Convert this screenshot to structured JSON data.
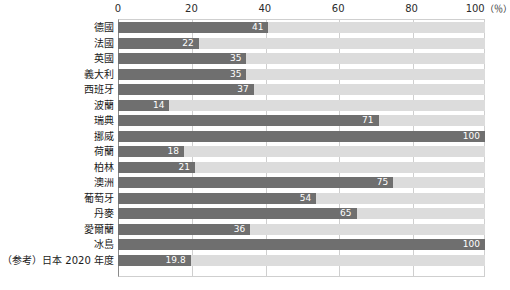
{
  "chart_data": {
    "type": "bar",
    "orientation": "horizontal",
    "title": "",
    "xlabel": "",
    "ylabel": "",
    "xlim": [
      0,
      100
    ],
    "unit": "%",
    "grid": true,
    "legend": "none",
    "axis": {
      "ticks": [
        {
          "value": 0,
          "label": "0"
        },
        {
          "value": 20,
          "label": "20"
        },
        {
          "value": 40,
          "label": "40"
        },
        {
          "value": 60,
          "label": "60"
        },
        {
          "value": 80,
          "label": "80"
        },
        {
          "value": 100,
          "label": "100"
        }
      ],
      "unit_label": "（％）"
    },
    "categories": [
      "德國",
      "法國",
      "英國",
      "義大利",
      "西班牙",
      "波蘭",
      "瑞典",
      "挪威",
      "荷蘭",
      "柏林",
      "澳洲",
      "葡萄牙",
      "丹麥",
      "愛爾蘭",
      "冰島",
      "（参考）日本 2020 年度"
    ],
    "values": [
      41,
      22,
      35,
      35,
      37,
      14,
      71,
      100,
      18,
      21,
      75,
      54,
      65,
      36,
      100,
      19.8
    ],
    "value_labels": [
      "41",
      "22",
      "35",
      "35",
      "37",
      "14",
      "71",
      "100",
      "18",
      "21",
      "75",
      "54",
      "65",
      "36",
      "100",
      "19.8"
    ],
    "colors": {
      "bar": "#6f6f6f",
      "track": "#dcdcdc",
      "grid": "#cfcfcf",
      "axis": "#8a8a8a",
      "value_text": "#ffffff",
      "label_text": "#1a1a1a"
    }
  }
}
